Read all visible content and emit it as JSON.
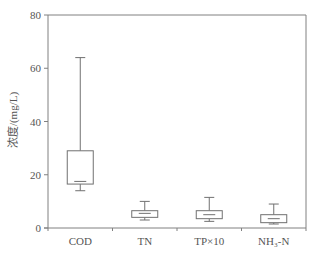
{
  "chart_data": {
    "type": "box",
    "title": "",
    "xlabel": "",
    "ylabel": "浓度/(mg/L)",
    "ylim": [
      0,
      80
    ],
    "yticks": [
      0,
      20,
      40,
      60,
      80
    ],
    "grid": false,
    "legend": null,
    "categories": [
      "COD",
      "TN",
      "TP×10",
      "NH₃-N"
    ],
    "boxes": [
      {
        "name": "COD",
        "whisker_low": 14,
        "q1": 16.5,
        "median": 17.5,
        "q3": 29,
        "whisker_high": 64
      },
      {
        "name": "TN",
        "whisker_low": 3,
        "q1": 4,
        "median": 5.5,
        "q3": 6.5,
        "whisker_high": 10
      },
      {
        "name": "TP×10",
        "whisker_low": 2.5,
        "q1": 3.5,
        "median": 5,
        "q3": 6.5,
        "whisker_high": 11.5
      },
      {
        "name": "NH₃-N",
        "whisker_low": 1.5,
        "q1": 2,
        "median": 3.5,
        "q3": 5,
        "whisker_high": 9
      }
    ]
  },
  "colors": {
    "axis": "#808080",
    "box": "#707070",
    "text": "#555555"
  }
}
